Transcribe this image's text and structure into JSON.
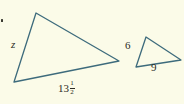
{
  "figure": {
    "kind": "similar-triangles-diagram",
    "background_color": "#fbfbe8",
    "stroke_color": "#3d6b7c",
    "text_color": "#2b2b24",
    "width": 184,
    "height": 104,
    "corner_mark": {
      "name": "corner-dot",
      "visible": true
    },
    "shapes": [
      {
        "id": "large-triangle",
        "label": "large-triangle",
        "points": "36,13 119,61 14,82",
        "stroke_width": 1.3
      },
      {
        "id": "small-triangle",
        "label": "small-triangle",
        "points": "146,37 181,60 136,67",
        "stroke_width": 1.3
      }
    ],
    "labels": {
      "large_left_side": "z",
      "large_base": {
        "whole": "13",
        "numerator": "1",
        "denominator": "2",
        "full": "13 1/2"
      },
      "small_left_side": "6",
      "small_base": "9"
    }
  }
}
